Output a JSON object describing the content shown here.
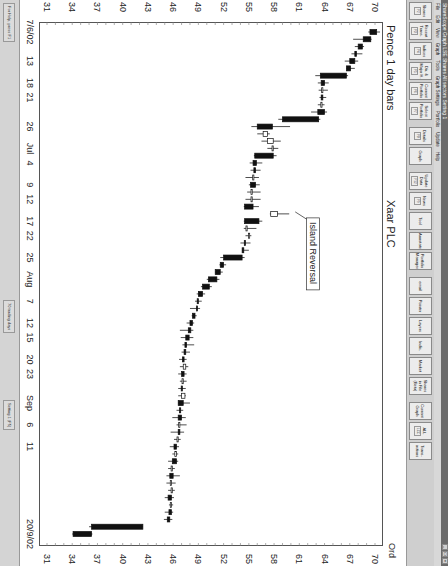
{
  "window": {
    "title": "ShareScope  Graph  LSE Shares  All sectors  Setting 1",
    "controls": [
      "_",
      "□",
      "×"
    ]
  },
  "menu": [
    "File",
    "Edit",
    "View",
    "Graph",
    "Tools",
    "Graph Settings",
    "Portfolio",
    "Update",
    "Help"
  ],
  "toolbar": {
    "buttons": [
      {
        "label": "Shares",
        "key": "F2"
      },
      {
        "label": "Recent Trans.",
        "key": "F3"
      },
      {
        "label": "Indices",
        "key": "F4"
      },
      {
        "label": "Dir. & Major H.",
        "key": "F5"
      },
      {
        "label": "Current Portfolio",
        "key": "F6"
      },
      {
        "label": "Select Portfolio",
        "key": "F7"
      },
      {
        "label": "Details",
        "key": "F8"
      },
      {
        "label": "Graph",
        "key": ""
      },
      {
        "label": "Update Data",
        "key": "F12"
      },
      {
        "label": "News",
        "key": "F9"
      },
      {
        "label": "Tool",
        "key": ""
      },
      {
        "label": "Annotate",
        "key": ""
      },
      {
        "label": "Portfolio Manager",
        "key": ""
      },
      {
        "label": "email",
        "key": ""
      },
      {
        "label": "Pointer",
        "key": ""
      },
      {
        "label": "Layers",
        "key": ""
      },
      {
        "label": "Indic.",
        "key": ""
      },
      {
        "label": "Market",
        "key": ""
      },
      {
        "label": "Shares in File (Beta)",
        "key": ""
      },
      {
        "label": "Current Graph",
        "key": ""
      },
      {
        "label": "ALL",
        "key": "LCC"
      },
      {
        "label": "Trans-actions",
        "key": ""
      }
    ]
  },
  "chart": {
    "header_left": "Pence 1 day bars",
    "header_mid": "Xaar PLC",
    "header_right": "Ord",
    "annotation": "Island Reversal"
  },
  "status": {
    "help": "For Help, press F1",
    "trading_days": "70 trading days",
    "setting": "Setting 1 (F5)"
  },
  "chart_data": {
    "type": "candlestick",
    "title": "Xaar PLC",
    "subtitle": "Pence 1 day bars",
    "ylabel": "Pence",
    "ylim": [
      31,
      70
    ],
    "yticks": [
      70,
      67,
      64,
      61,
      58,
      55,
      52,
      49,
      46,
      43,
      40,
      37,
      34,
      31
    ],
    "xlabel": "",
    "xticks": [
      "7/6/02",
      "13",
      "18",
      "21",
      "26",
      "Jul",
      "4",
      "9",
      "12",
      "17",
      "22",
      "25",
      "Aug",
      "7",
      "12",
      "15",
      "20",
      "23",
      "Sep",
      "6",
      "11",
      "20/9/02"
    ],
    "annotations": [
      {
        "text": "Island Reversal",
        "x_index": 25
      }
    ],
    "candles": [
      {
        "o": 70.2,
        "h": 70.6,
        "l": 69.2,
        "c": 69.4
      },
      {
        "o": 69.5,
        "h": 69.6,
        "l": 67.4,
        "c": 68.6
      },
      {
        "o": 68.5,
        "h": 68.7,
        "l": 67.6,
        "c": 68.0
      },
      {
        "o": 67.8,
        "h": 68.5,
        "l": 67.2,
        "c": 67.6
      },
      {
        "o": 67.6,
        "h": 68.0,
        "l": 66.4,
        "c": 67.0
      },
      {
        "o": 67.1,
        "h": 67.6,
        "l": 66.6,
        "c": 66.6
      },
      {
        "o": 66.6,
        "h": 66.8,
        "l": 62.9,
        "c": 63.5
      },
      {
        "o": 64.0,
        "h": 64.5,
        "l": 63.2,
        "c": 63.6
      },
      {
        "o": 63.8,
        "h": 64.4,
        "l": 63.3,
        "c": 63.8
      },
      {
        "o": 63.8,
        "h": 64.2,
        "l": 63.4,
        "c": 63.6
      },
      {
        "o": 63.7,
        "h": 64.0,
        "l": 63.2,
        "c": 63.7
      },
      {
        "o": 64.0,
        "h": 64.3,
        "l": 62.4,
        "c": 63.2
      },
      {
        "o": 63.3,
        "h": 63.5,
        "l": 58.5,
        "c": 59.0
      },
      {
        "o": 57.8,
        "h": 59.9,
        "l": 55.3,
        "c": 56.0
      },
      {
        "o": 56.7,
        "h": 57.5,
        "l": 56.0,
        "c": 57.2
      },
      {
        "o": 57.2,
        "h": 58.8,
        "l": 56.5,
        "c": 57.9
      },
      {
        "o": 57.9,
        "h": 58.5,
        "l": 57.2,
        "c": 57.9
      },
      {
        "o": 57.9,
        "h": 58.3,
        "l": 55.6,
        "c": 55.7
      },
      {
        "o": 55.9,
        "h": 56.6,
        "l": 55.1,
        "c": 55.5
      },
      {
        "o": 55.8,
        "h": 56.4,
        "l": 55.2,
        "c": 55.6
      },
      {
        "o": 55.6,
        "h": 56.2,
        "l": 54.6,
        "c": 55.6
      },
      {
        "o": 55.8,
        "h": 56.3,
        "l": 55.0,
        "c": 55.2
      },
      {
        "o": 55.3,
        "h": 56.4,
        "l": 54.8,
        "c": 55.4
      },
      {
        "o": 55.4,
        "h": 56.4,
        "l": 54.6,
        "c": 55.4
      },
      {
        "o": 55.5,
        "h": 56.2,
        "l": 54.4,
        "c": 54.5
      },
      {
        "o": 57.6,
        "h": 59.8,
        "l": 57.5,
        "c": 58.4
      },
      {
        "o": 56.2,
        "h": 56.6,
        "l": 54.4,
        "c": 54.5
      },
      {
        "o": 54.8,
        "h": 55.9,
        "l": 54.4,
        "c": 54.8
      },
      {
        "o": 55.0,
        "h": 55.3,
        "l": 54.6,
        "c": 55.1
      },
      {
        "o": 54.6,
        "h": 55.2,
        "l": 54.0,
        "c": 54.5
      },
      {
        "o": 54.4,
        "h": 55.0,
        "l": 54.2,
        "c": 54.2
      },
      {
        "o": 54.2,
        "h": 54.5,
        "l": 51.6,
        "c": 52.0
      },
      {
        "o": 52.0,
        "h": 52.3,
        "l": 51.5,
        "c": 51.6
      },
      {
        "o": 51.6,
        "h": 51.9,
        "l": 51.0,
        "c": 51.0
      },
      {
        "o": 51.2,
        "h": 51.5,
        "l": 50.0,
        "c": 50.2
      },
      {
        "o": 50.3,
        "h": 50.6,
        "l": 49.3,
        "c": 49.5
      },
      {
        "o": 49.5,
        "h": 49.8,
        "l": 48.8,
        "c": 49.0
      },
      {
        "o": 49.0,
        "h": 49.4,
        "l": 48.6,
        "c": 48.9
      },
      {
        "o": 48.9,
        "h": 49.2,
        "l": 48.0,
        "c": 48.8
      },
      {
        "o": 48.6,
        "h": 48.8,
        "l": 48.2,
        "c": 48.3
      },
      {
        "o": 48.3,
        "h": 48.5,
        "l": 47.6,
        "c": 48.0
      },
      {
        "o": 48.1,
        "h": 48.4,
        "l": 46.8,
        "c": 47.8
      },
      {
        "o": 47.9,
        "h": 48.4,
        "l": 46.9,
        "c": 47.5
      },
      {
        "o": 47.6,
        "h": 48.5,
        "l": 47.1,
        "c": 47.4
      },
      {
        "o": 47.5,
        "h": 48.0,
        "l": 47.0,
        "c": 47.3
      },
      {
        "o": 47.3,
        "h": 47.6,
        "l": 46.7,
        "c": 47.1
      },
      {
        "o": 47.2,
        "h": 47.8,
        "l": 46.8,
        "c": 47.5
      },
      {
        "o": 47.3,
        "h": 47.6,
        "l": 46.6,
        "c": 47.0
      },
      {
        "o": 47.2,
        "h": 47.6,
        "l": 46.8,
        "c": 47.2
      },
      {
        "o": 47.1,
        "h": 47.5,
        "l": 46.6,
        "c": 47.0
      },
      {
        "o": 47.0,
        "h": 47.5,
        "l": 46.6,
        "c": 47.4
      },
      {
        "o": 47.2,
        "h": 48.0,
        "l": 46.6,
        "c": 46.6
      },
      {
        "o": 46.9,
        "h": 47.2,
        "l": 46.4,
        "c": 46.8
      },
      {
        "o": 47.0,
        "h": 47.5,
        "l": 45.9,
        "c": 46.6
      },
      {
        "o": 46.8,
        "h": 47.6,
        "l": 46.4,
        "c": 46.8
      },
      {
        "o": 46.8,
        "h": 47.3,
        "l": 45.7,
        "c": 46.6
      },
      {
        "o": 46.6,
        "h": 46.9,
        "l": 46.1,
        "c": 46.6
      },
      {
        "o": 46.4,
        "h": 46.7,
        "l": 45.6,
        "c": 46.1
      },
      {
        "o": 46.2,
        "h": 46.6,
        "l": 45.9,
        "c": 46.4
      },
      {
        "o": 46.4,
        "h": 46.6,
        "l": 45.4,
        "c": 45.9
      },
      {
        "o": 45.9,
        "h": 46.2,
        "l": 45.4,
        "c": 45.9
      },
      {
        "o": 46.0,
        "h": 46.8,
        "l": 45.2,
        "c": 45.6
      },
      {
        "o": 45.8,
        "h": 46.3,
        "l": 45.2,
        "c": 45.8
      },
      {
        "o": 45.9,
        "h": 46.2,
        "l": 45.4,
        "c": 45.9
      },
      {
        "o": 45.8,
        "h": 46.1,
        "l": 45.0,
        "c": 45.4
      },
      {
        "o": 45.8,
        "h": 46.0,
        "l": 45.5,
        "c": 45.8
      },
      {
        "o": 45.8,
        "h": 46.0,
        "l": 45.0,
        "c": 45.5
      },
      {
        "o": 45.6,
        "h": 45.9,
        "l": 44.9,
        "c": 45.3
      },
      {
        "o": 42.4,
        "h": 42.4,
        "l": 36.0,
        "c": 36.3
      },
      {
        "o": 36.3,
        "h": 36.4,
        "l": 34.0,
        "c": 34.1
      }
    ]
  }
}
